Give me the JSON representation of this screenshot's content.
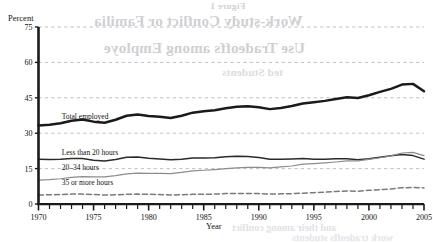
{
  "chart_data": {
    "type": "line",
    "title": "",
    "xlabel": "Year",
    "ylabel": "Percent",
    "xlim": [
      1970,
      2005
    ],
    "ylim": [
      0,
      75
    ],
    "yticks": [
      0,
      15,
      30,
      45,
      60,
      75
    ],
    "xticks": [
      1970,
      1975,
      1980,
      1985,
      1990,
      1995,
      2000,
      2005
    ],
    "xtick_labels": [
      "1970",
      "1975",
      "1980",
      "1985",
      "1990",
      "1995",
      "2000",
      "2005"
    ],
    "ytick_labels": [
      "0",
      "15",
      "30",
      "45",
      "60",
      "75"
    ],
    "minor_xticks_every": 1,
    "grid": "horizontal-dashed",
    "legend": "inline-labels",
    "x": [
      1970,
      1971,
      1972,
      1973,
      1974,
      1975,
      1976,
      1977,
      1978,
      1979,
      1980,
      1981,
      1982,
      1983,
      1984,
      1985,
      1986,
      1987,
      1988,
      1989,
      1990,
      1991,
      1992,
      1993,
      1994,
      1995,
      1996,
      1997,
      1998,
      1999,
      2000,
      2001,
      2002,
      2003,
      2004,
      2005
    ],
    "series": [
      {
        "name": "Total employed",
        "style": "solid-thick-black",
        "color": "#1a1a1a",
        "label_x": 1972.1,
        "label_y": 36.0,
        "values": [
          33.3,
          33.6,
          34.2,
          35.3,
          35.8,
          34.9,
          34.4,
          35.7,
          37.4,
          37.9,
          37.3,
          37.0,
          36.4,
          37.4,
          38.7,
          39.3,
          39.7,
          40.6,
          41.2,
          41.4,
          41.0,
          40.2,
          40.7,
          41.5,
          42.6,
          43.1,
          43.7,
          44.5,
          45.2,
          44.9,
          46.1,
          47.5,
          48.8,
          50.6,
          50.9,
          47.8
        ]
      },
      {
        "name": "Less than 20 hours",
        "style": "solid-black",
        "color": "#2a2a2a",
        "label_x": 1972.1,
        "label_y": 20.9,
        "values": [
          19.0,
          18.9,
          19.0,
          19.3,
          19.3,
          18.5,
          18.2,
          18.9,
          19.8,
          19.9,
          19.4,
          19.1,
          18.7,
          19.0,
          19.5,
          19.5,
          19.6,
          20.0,
          20.2,
          20.1,
          19.7,
          19.0,
          19.0,
          19.1,
          19.3,
          19.0,
          19.0,
          19.2,
          19.2,
          18.8,
          19.2,
          19.8,
          20.4,
          21.0,
          20.5,
          19.0
        ]
      },
      {
        "name": "20–34 hours",
        "style": "solid-gray",
        "color": "#8c8c8c",
        "label_x": 1972.1,
        "label_y": 14.6,
        "values": [
          10.1,
          10.3,
          10.7,
          11.3,
          11.6,
          11.5,
          11.5,
          12.0,
          12.8,
          13.1,
          13.0,
          13.0,
          12.9,
          13.4,
          14.0,
          14.3,
          14.6,
          15.0,
          15.3,
          15.5,
          15.5,
          15.3,
          15.7,
          16.1,
          16.9,
          17.1,
          17.4,
          17.8,
          18.3,
          18.3,
          18.9,
          19.6,
          20.4,
          21.6,
          21.9,
          20.5
        ]
      },
      {
        "name": "35 or more hours",
        "style": "dashed-gray",
        "color": "#7a7a7a",
        "label_x": 1972.1,
        "label_y": 8.2,
        "values": [
          3.8,
          3.9,
          4.0,
          4.2,
          4.2,
          4.0,
          3.8,
          3.9,
          4.1,
          4.2,
          4.1,
          4.0,
          3.8,
          3.9,
          4.1,
          4.1,
          4.2,
          4.4,
          4.5,
          4.5,
          4.4,
          4.2,
          4.3,
          4.4,
          4.6,
          4.8,
          5.0,
          5.3,
          5.5,
          5.4,
          5.8,
          6.1,
          6.4,
          6.9,
          7.0,
          6.8
        ]
      }
    ]
  },
  "bleed_through": {
    "line1": "Figure 1",
    "line2": "Work-study Conflict or Familia",
    "line3": "Use Tradeoffs among Employe",
    "line4": "ted Students",
    "line5": "and their among conflict",
    "line6": "work tradeoffs students"
  }
}
